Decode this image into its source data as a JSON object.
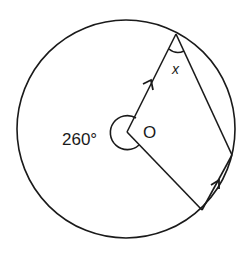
{
  "diagram": {
    "type": "circle-geometry",
    "center_label": "O",
    "reflex_angle_label": "260°",
    "unknown_angle_label": "x",
    "stroke_color": "#1a1a1a",
    "background": "#ffffff"
  }
}
